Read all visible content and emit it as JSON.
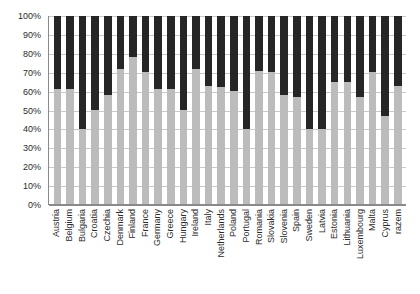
{
  "chart_data": {
    "type": "bar",
    "subtype": "stacked-100-percent",
    "title": "",
    "subtitle": "",
    "xlabel": "",
    "ylabel": "",
    "ylim": [
      0,
      100
    ],
    "ytick_labels": [
      "100%",
      "90%",
      "80%",
      "70%",
      "60%",
      "50%",
      "40%",
      "30%",
      "20%",
      "10%",
      "0%"
    ],
    "ytick_values": [
      100,
      90,
      80,
      70,
      60,
      50,
      40,
      30,
      20,
      10,
      0
    ],
    "grid": true,
    "legend": "none",
    "categories": [
      "Austria",
      "Belgium",
      "Bulgaria",
      "Croatia",
      "Czechia",
      "Denmark",
      "Finland",
      "France",
      "Germany",
      "Greece",
      "Hungary",
      "Ireland",
      "Italy",
      "Netherlands",
      "Poland",
      "Portugal",
      "Romania",
      "Slovakia",
      "Slovenia",
      "Spain",
      "Sweden",
      "Latvia",
      "Estonia",
      "Lithuania",
      "Luxembourg",
      "Malta",
      "Cyprus",
      "razem"
    ],
    "series": [
      {
        "name": "lower-segment",
        "color": "#bcbcbc",
        "values": [
          61,
          61,
          40,
          50,
          58,
          72,
          78,
          70,
          61,
          61,
          50,
          72,
          63,
          62,
          60,
          40,
          71,
          70,
          58,
          57,
          40,
          40,
          65,
          65,
          57,
          70,
          47,
          63
        ]
      },
      {
        "name": "upper-segment",
        "color": "#262626",
        "values": [
          39,
          39,
          60,
          50,
          42,
          28,
          22,
          30,
          39,
          39,
          50,
          28,
          37,
          38,
          40,
          60,
          29,
          30,
          42,
          43,
          60,
          60,
          35,
          35,
          43,
          30,
          53,
          37
        ]
      }
    ]
  },
  "colors": {
    "segment_lower": "#bcbcbc",
    "segment_upper": "#262626",
    "gridline": "#c9c9c9",
    "axis": "#8a8a8a",
    "text": "#2b2b2b",
    "background": "#ffffff"
  }
}
